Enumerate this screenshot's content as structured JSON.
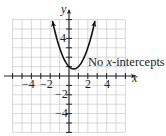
{
  "chart_data": {
    "type": "line",
    "title": "",
    "xlabel": "x",
    "ylabel": "y",
    "xlim": [
      -6,
      6
    ],
    "ylim": [
      -6,
      6
    ],
    "grid": true,
    "grid_step": 1,
    "x_tick_labels": [
      {
        "value": -4,
        "label": "−4"
      },
      {
        "value": -2,
        "label": "−2"
      },
      {
        "value": 2,
        "label": "2"
      },
      {
        "value": 4,
        "label": "4"
      }
    ],
    "y_tick_labels": [
      {
        "value": 4,
        "label": "4"
      },
      {
        "value": -2,
        "label": "−2"
      },
      {
        "value": -4,
        "label": "−4"
      }
    ],
    "series": [
      {
        "name": "parabola",
        "equation": "y = x^2 - x + 1",
        "vertex": [
          0.5,
          0.75
        ],
        "x": [
          -1.76,
          -1.5,
          -1,
          -0.5,
          0,
          0.5,
          1,
          1.5,
          2,
          2.5,
          2.76
        ],
        "y": [
          5.86,
          4.75,
          3.0,
          1.75,
          1.0,
          0.75,
          1.0,
          1.75,
          3.0,
          4.75,
          5.86
        ],
        "arrows_at_ends": true
      }
    ],
    "annotations": [
      {
        "text_prefix": "No ",
        "text_italic": "x",
        "text_suffix": "-intercepts",
        "position": [
          2.0,
          0.9
        ]
      }
    ],
    "legend": null
  },
  "labels": {
    "x_axis": "x",
    "y_axis": "y",
    "x_ticks": [
      "−4",
      "−2",
      "2",
      "4"
    ],
    "y_ticks": [
      "4",
      "−2",
      "−4"
    ],
    "annotation_prefix": "No ",
    "annotation_italic": "x",
    "annotation_suffix": "-intercepts"
  },
  "colors": {
    "grid": "#c8c8c8",
    "axis": "#222222",
    "curve": "#111111",
    "text": "#222222"
  }
}
